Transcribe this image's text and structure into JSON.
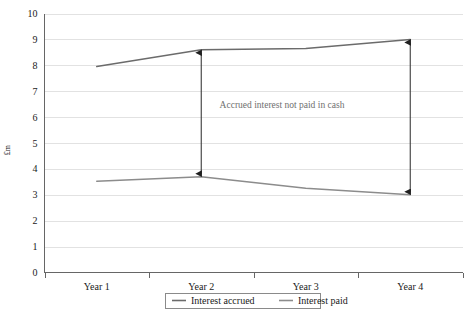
{
  "chart_data": {
    "type": "line",
    "title": "",
    "xlabel": "",
    "ylabel": "£m",
    "categories": [
      "Year 1",
      "Year 2",
      "Year 3",
      "Year 4"
    ],
    "ylim": [
      0,
      10
    ],
    "yticks": [
      0,
      1,
      2,
      3,
      4,
      5,
      6,
      7,
      8,
      9,
      10
    ],
    "ytick_labels": [
      "0",
      "1",
      "2",
      "3",
      "4",
      "5",
      "6",
      "7",
      "8",
      "9",
      "10"
    ],
    "grid": true,
    "legend_position": "bottom",
    "series": [
      {
        "name": "Interest accrued",
        "color": "#6b6b6b",
        "values": [
          7.95,
          8.6,
          8.65,
          9.0
        ]
      },
      {
        "name": "Interest paid",
        "color": "#8c8c8c",
        "values": [
          3.52,
          3.7,
          3.25,
          3.0
        ]
      }
    ],
    "annotations": [
      {
        "name": "gap-arrow-year-2",
        "category": "Year 2",
        "from": 3.7,
        "to": 8.6,
        "label": ""
      },
      {
        "name": "gap-arrow-year-4",
        "category": "Year 4",
        "from": 3.0,
        "to": 9.0,
        "label": ""
      },
      {
        "name": "gap-caption",
        "label": "Accrued interest not paid in cash",
        "color": "#6f6f6f"
      }
    ]
  },
  "legend": {
    "items": [
      {
        "label": "Interest accrued",
        "color": "#6b6b6b"
      },
      {
        "label": "Interest paid",
        "color": "#8c8c8c"
      }
    ]
  },
  "axis": {
    "y_title": "£m",
    "y_labels": [
      "10",
      "9",
      "8",
      "7",
      "6",
      "5",
      "4",
      "3",
      "2",
      "1",
      "0"
    ],
    "x_labels": [
      "Year 1",
      "Year 2",
      "Year 3",
      "Year 4"
    ]
  },
  "annotation": {
    "caption": "Accrued interest not paid in cash"
  },
  "colors": {
    "accrued": "#6b6b6b",
    "paid": "#8c8c8c",
    "grid": "#e2e2e2",
    "axis": "#666666",
    "annotation_text": "#6f6f6f",
    "arrow": "#3a3a3a"
  }
}
